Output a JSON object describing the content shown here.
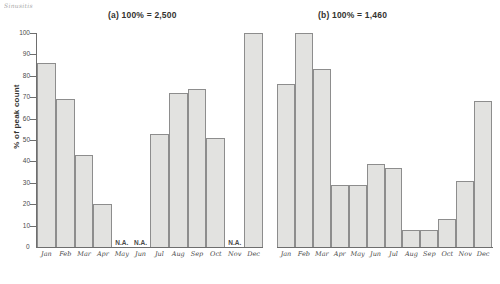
{
  "annotation": {
    "scribble": "Sinusitis"
  },
  "chart_data": {
    "type": "bar",
    "title": "",
    "xlabel": "",
    "ylabel": "% of peak count",
    "ylim": [
      0,
      100
    ],
    "yticks": [
      0,
      10,
      20,
      30,
      40,
      50,
      60,
      70,
      80,
      90,
      100
    ],
    "grid": false,
    "legend": "none",
    "panels": [
      {
        "key": "a",
        "title": "(a) 100% = 2,500",
        "categories": [
          "Jan",
          "Feb",
          "Mar",
          "Apr",
          "May",
          "Jun",
          "Jul",
          "Aug",
          "Sep",
          "Oct",
          "Nov",
          "Dec"
        ],
        "values": [
          86,
          69,
          43,
          20,
          null,
          null,
          53,
          72,
          74,
          51,
          null,
          100
        ],
        "missing_label": "N.A.",
        "missing": [
          "May",
          "Jun",
          "Nov"
        ]
      },
      {
        "key": "b",
        "title": "(b) 100% = 1,460",
        "categories": [
          "Jan",
          "Feb",
          "Mar",
          "Apr",
          "May",
          "Jun",
          "Jul",
          "Aug",
          "Sep",
          "Oct",
          "Nov",
          "Dec"
        ],
        "values": [
          76,
          100,
          83,
          29,
          29,
          39,
          37,
          8,
          8,
          13,
          31,
          68
        ],
        "missing_label": "N.A.",
        "missing": []
      }
    ],
    "colors": {
      "bar_fill": "#e2e2e0",
      "bar_stroke": "#8d8d8d",
      "axis": "#6e6e6e",
      "text": "#3c3c3c"
    }
  }
}
